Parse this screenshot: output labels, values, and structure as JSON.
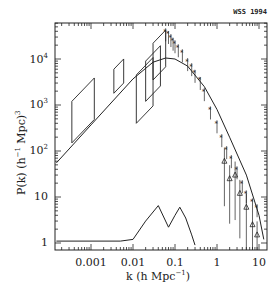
{
  "chart_data": {
    "type": "scatter",
    "title": "",
    "annotation": "WSS 1994",
    "xlabel": "k (h Mpc^-1)",
    "ylabel": "P(k) (h^-1 Mpc)^3",
    "xscale": "log",
    "yscale": "log",
    "xlim": [
      0.00015,
      15
    ],
    "ylim": [
      0.85,
      60000
    ],
    "x_ticks": [
      "0.001",
      "0.01",
      "0.1",
      "1",
      "10"
    ],
    "y_ticks": [
      "1",
      "10",
      "10^2",
      "10^3",
      "10^4"
    ],
    "grid": false,
    "legend": null,
    "series": [
      {
        "name": "model power spectrum curve",
        "type": "line",
        "x": [
          0.00015,
          0.001,
          0.01,
          0.03,
          0.06,
          0.1,
          0.2,
          0.5,
          1,
          2,
          5,
          10,
          13
        ],
        "y": [
          55,
          370,
          3700,
          8500,
          10500,
          10000,
          7000,
          2500,
          800,
          200,
          30,
          4,
          1.2
        ]
      },
      {
        "name": "data points (galaxy / cluster surveys)",
        "type": "scatter",
        "x": [
          0.06,
          0.07,
          0.08,
          0.09,
          0.1,
          0.12,
          0.15,
          0.2,
          0.25,
          0.3,
          0.4,
          0.5,
          0.7,
          1.0,
          1.3,
          1.7,
          2.2,
          3,
          4,
          5,
          7,
          9
        ],
        "y": [
          40000,
          35000,
          30000,
          25000,
          22000,
          18000,
          14000,
          9000,
          7000,
          5000,
          3500,
          2000,
          800,
          400,
          200,
          110,
          70,
          40,
          20,
          12,
          8,
          6
        ]
      },
      {
        "name": "triangle data points",
        "type": "scatter",
        "x": [
          1.5,
          2.0,
          2.7,
          3.5,
          5,
          7,
          9
        ],
        "y": [
          60,
          25,
          30,
          12,
          6,
          2.5,
          1.5
        ]
      },
      {
        "name": "COBE / large-scale constraint boxes",
        "type": "box",
        "boxes": [
          {
            "k": [
              0.00035,
              0.0012
            ],
            "P": [
              150,
              1200
            ]
          },
          {
            "k": [
              0.0035,
              0.006
            ],
            "P": [
              1800,
              6000
            ]
          },
          {
            "k": [
              0.012,
              0.03
            ],
            "P": [
              400,
              4500
            ]
          },
          {
            "k": [
              0.02,
              0.045
            ],
            "P": [
              1200,
              9000
            ]
          },
          {
            "k": [
              0.03,
              0.06
            ],
            "P": [
              3500,
              22000
            ]
          }
        ]
      },
      {
        "name": "window function",
        "type": "line",
        "x": [
          0.00015,
          0.005,
          0.01,
          0.02,
          0.04,
          0.07,
          0.1,
          0.13,
          0.18,
          0.25,
          0.3
        ],
        "y": [
          1.1,
          1.1,
          1.2,
          3,
          6.5,
          2.2,
          4,
          6,
          3.5,
          1.5,
          0.9
        ]
      }
    ]
  }
}
